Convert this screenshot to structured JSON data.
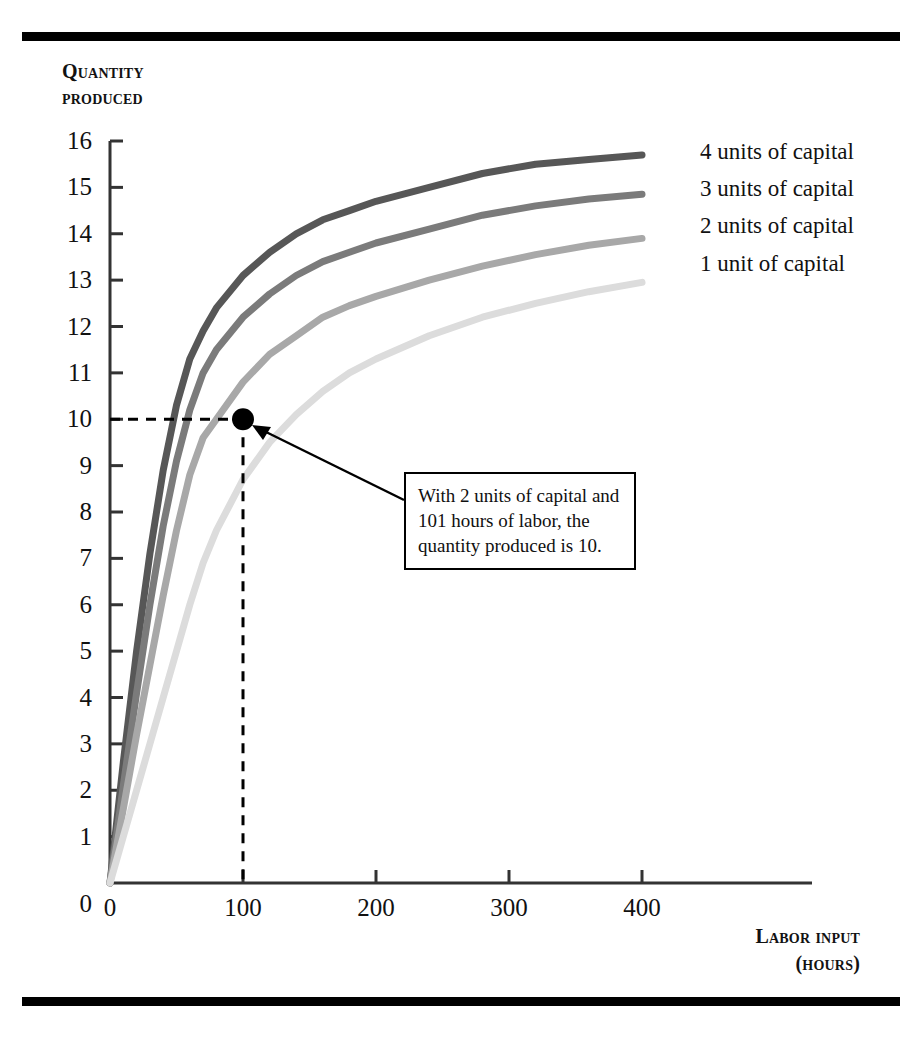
{
  "figure": {
    "background_color": "#ffffff",
    "rule_color": "#000000",
    "axis_color": "#333333"
  },
  "axes": {
    "y_title_line1": "Quantity",
    "y_title_line2": "produced",
    "x_title_line1": "Labor input",
    "x_title_line2": "(hours)",
    "y_ticks": [
      "0",
      "1",
      "2",
      "3",
      "4",
      "5",
      "6",
      "7",
      "8",
      "9",
      "10",
      "11",
      "12",
      "13",
      "14",
      "15",
      "16"
    ],
    "x_ticks": [
      "0",
      "100",
      "200",
      "300",
      "400"
    ]
  },
  "legend": {
    "items": [
      {
        "label": "4 units of capital",
        "color": "#575757"
      },
      {
        "label": "3 units of capital",
        "color": "#7b7b7b"
      },
      {
        "label": "2 units of capital",
        "color": "#a8a8a8"
      },
      {
        "label": "1 unit of capital",
        "color": "#dcdcdc"
      }
    ]
  },
  "annotation": {
    "line1": "With 2 units of capital and",
    "line2": "101 hours of labor, the",
    "line3": "quantity produced is 10.",
    "marker_x": 100,
    "marker_y": 10,
    "marker_color": "#000000"
  },
  "chart_data": {
    "type": "line",
    "title": "",
    "xlabel": "Labor input (hours)",
    "ylabel": "Quantity produced",
    "xlim": [
      0,
      440
    ],
    "ylim": [
      0,
      16
    ],
    "grid": false,
    "legend_position": "right-inline",
    "x": [
      0,
      10,
      20,
      30,
      40,
      50,
      60,
      70,
      80,
      100,
      120,
      140,
      160,
      180,
      200,
      240,
      280,
      320,
      360,
      400
    ],
    "series": [
      {
        "name": "4 units of capital",
        "color": "#575757",
        "values": [
          0,
          2.6,
          5.0,
          7.1,
          8.9,
          10.3,
          11.3,
          11.9,
          12.4,
          13.1,
          13.6,
          14.0,
          14.3,
          14.5,
          14.7,
          15.0,
          15.3,
          15.5,
          15.6,
          15.7
        ]
      },
      {
        "name": "3 units of capital",
        "color": "#7b7b7b",
        "values": [
          0,
          2.1,
          4.1,
          6.0,
          7.7,
          9.1,
          10.2,
          11.0,
          11.5,
          12.2,
          12.7,
          13.1,
          13.4,
          13.6,
          13.8,
          14.1,
          14.4,
          14.6,
          14.75,
          14.85
        ]
      },
      {
        "name": "2 units of capital",
        "color": "#a8a8a8",
        "values": [
          0,
          1.6,
          3.2,
          4.7,
          6.2,
          7.6,
          8.8,
          9.6,
          10.0,
          10.8,
          11.4,
          11.8,
          12.2,
          12.45,
          12.65,
          13.0,
          13.3,
          13.55,
          13.75,
          13.9
        ]
      },
      {
        "name": "1 unit of capital",
        "color": "#dcdcdc",
        "values": [
          0,
          1.0,
          2.0,
          3.0,
          4.0,
          5.0,
          6.0,
          6.9,
          7.6,
          8.7,
          9.5,
          10.1,
          10.6,
          11.0,
          11.3,
          11.8,
          12.2,
          12.5,
          12.75,
          12.95
        ]
      }
    ],
    "annotations": [
      {
        "text": "With 2 units of capital and 101 hours of labor, the quantity produced is 10.",
        "point": [
          100,
          10
        ],
        "series": "2 units of capital"
      }
    ]
  }
}
